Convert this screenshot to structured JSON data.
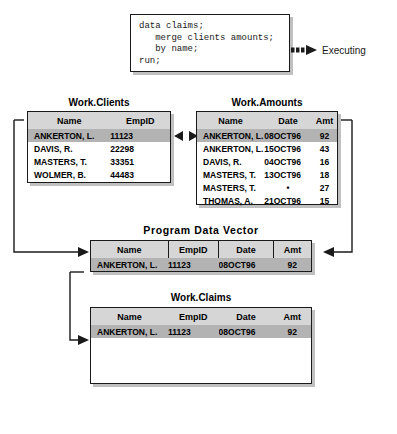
{
  "code_block": {
    "lines": [
      "data claims;",
      "   merge clients amounts;",
      "   by name;",
      "run;"
    ],
    "text": "data claims;\n   merge clients amounts;\n   by name;\nrun;"
  },
  "status": {
    "label": "Executing",
    "arrow_icon": "dashed-right-arrow-icon"
  },
  "merge_indicator": {
    "left_icon": "left-triangle-icon",
    "right_icon": "right-triangle-icon"
  },
  "tables": {
    "clients": {
      "caption": "Work.Clients",
      "columns": [
        "Name",
        "EmpID"
      ],
      "rows": [
        {
          "cells": [
            "ANKERTON, L.",
            "11123"
          ],
          "highlighted": true
        },
        {
          "cells": [
            "DAVIS, R.",
            "22298"
          ],
          "highlighted": false
        },
        {
          "cells": [
            "MASTERS, T.",
            "33351"
          ],
          "highlighted": false
        },
        {
          "cells": [
            "WOLMER, B.",
            "44483"
          ],
          "highlighted": false
        }
      ]
    },
    "amounts": {
      "caption": "Work.Amounts",
      "columns": [
        "Name",
        "Date",
        "Amt"
      ],
      "rows": [
        {
          "cells": [
            "ANKERTON, L.",
            "08OCT96",
            "92"
          ],
          "highlighted": true
        },
        {
          "cells": [
            "ANKERTON, L.",
            "15OCT96",
            "43"
          ],
          "highlighted": false
        },
        {
          "cells": [
            "DAVIS, R.",
            "04OCT96",
            "16"
          ],
          "highlighted": false
        },
        {
          "cells": [
            "MASTERS, T.",
            "13OCT96",
            "18"
          ],
          "highlighted": false
        },
        {
          "cells": [
            "MASTERS, T.",
            "•",
            "27"
          ],
          "highlighted": false
        },
        {
          "cells": [
            "THOMAS, A.",
            "21OCT96",
            "15"
          ],
          "highlighted": false
        }
      ]
    },
    "pdv": {
      "caption": "Program Data Vector",
      "columns": [
        "Name",
        "EmpID",
        "Date",
        "Amt"
      ],
      "rows": [
        {
          "cells": [
            "ANKERTON, L.",
            "11123",
            "08OCT96",
            "92"
          ],
          "highlighted": true
        }
      ]
    },
    "claims": {
      "caption": "Work.Claims",
      "columns": [
        "Name",
        "EmpID",
        "Date",
        "Amt"
      ],
      "rows": [
        {
          "cells": [
            "ANKERTON, L.",
            "11123",
            "08OCT96",
            "92"
          ],
          "highlighted": true
        }
      ]
    }
  },
  "colors": {
    "header_fill": "#d6d6d6",
    "highlight_fill": "#b3b3b3",
    "line": "#1a1a1a",
    "background": "#ffffff"
  }
}
